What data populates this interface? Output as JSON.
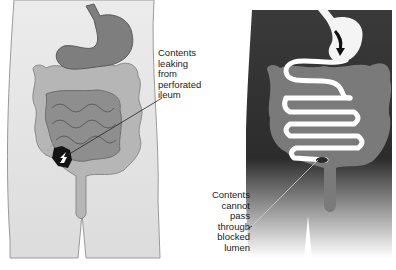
{
  "diagram": {
    "type": "medical-illustration",
    "panels": [
      {
        "id": "perforation",
        "position": "left",
        "background": "light",
        "label": "Contents\nleaking\nfrom\nperforated\nileum",
        "highlight": "dark perforation site at lower-left (ileum) with white arrow indicating leakage"
      },
      {
        "id": "obstruction",
        "position": "right",
        "background": "dark",
        "label": "Contents\ncannot\npass\nthrough\nblocked\nlumen",
        "highlight": "white small intestine lumen with arrow from stomach; blockage at terminal ileum"
      }
    ]
  },
  "colors": {
    "body_light": "#e4e4e4",
    "body_dark": "#333333",
    "organ_gray": "#8c8c8c",
    "colon_gray": "#b4b4b4",
    "colon_dark_panel": "#7a7a7a",
    "lumen_white": "#ffffff",
    "perforation": "#111111",
    "text": "#1a1a1a"
  }
}
